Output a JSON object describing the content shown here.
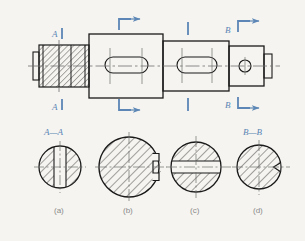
{
  "figure": {
    "type": "engineering-drawing",
    "background_color": "#f5f4f0",
    "line_color": "#1a1a1a",
    "annotation_color": "#5b86b5",
    "caption_color": "#8a8a8a",
    "centerline_color": "#6e6e6e"
  },
  "main_view": {
    "name": "shaft-elevation",
    "cut_marks": [
      {
        "id": "A-top",
        "label": "A",
        "x": 59,
        "y": 33,
        "position": "top"
      },
      {
        "id": "A-bot",
        "label": "A",
        "x": 59,
        "y": 104,
        "position": "bottom"
      },
      {
        "id": "c1-top",
        "label": "",
        "x": 123,
        "y": 28,
        "position": "top"
      },
      {
        "id": "c1-bot",
        "label": "",
        "x": 123,
        "y": 105,
        "position": "bottom"
      },
      {
        "id": "c2-top",
        "label": "",
        "x": 188,
        "y": 30,
        "position": "top"
      },
      {
        "id": "c2-bot",
        "label": "",
        "x": 188,
        "y": 104,
        "position": "bottom"
      },
      {
        "id": "B-top",
        "label": "B",
        "x": 245,
        "y": 30,
        "position": "top"
      },
      {
        "id": "B-bot",
        "label": "B",
        "x": 245,
        "y": 104,
        "position": "bottom"
      }
    ]
  },
  "sections": [
    {
      "id": "a",
      "title": "A—A",
      "caption": "(a)",
      "shape": "circle-with-flat-slot",
      "cx": 60,
      "cy": 167,
      "r": 21
    },
    {
      "id": "b",
      "title": "",
      "caption": "(b)",
      "shape": "circle-with-keyway-notch",
      "cx": 129,
      "cy": 167,
      "r": 30
    },
    {
      "id": "c",
      "title": "",
      "caption": "(c)",
      "shape": "circle-with-through-slot",
      "cx": 196,
      "cy": 167,
      "r": 25
    },
    {
      "id": "d",
      "title": "B—B",
      "caption": "(d)",
      "shape": "circle-with-small-notch",
      "cx": 259,
      "cy": 167,
      "r": 22
    }
  ]
}
